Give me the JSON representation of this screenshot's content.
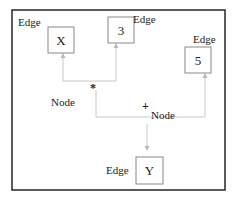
{
  "diagram": {
    "type": "expression-tree",
    "nodes": [
      {
        "id": "x",
        "value": "X",
        "label": "Edge"
      },
      {
        "id": "three",
        "value": "3",
        "label": "Edge"
      },
      {
        "id": "five",
        "value": "5",
        "label": "Edge"
      },
      {
        "id": "y",
        "value": "Y",
        "label": "Edge"
      }
    ],
    "operators": [
      {
        "id": "mul",
        "symbol": "*",
        "label": "Node"
      },
      {
        "id": "add",
        "symbol": "+",
        "label": "Node"
      }
    ],
    "edges": [
      {
        "from": "mul",
        "to": "x"
      },
      {
        "from": "mul",
        "to": "three"
      },
      {
        "from": "add",
        "to": "mul"
      },
      {
        "from": "add",
        "to": "five"
      },
      {
        "from": "add",
        "to": "y"
      }
    ],
    "colors": {
      "frame": "#333333",
      "box": "#888888",
      "connector": "#c8c8c8"
    }
  }
}
